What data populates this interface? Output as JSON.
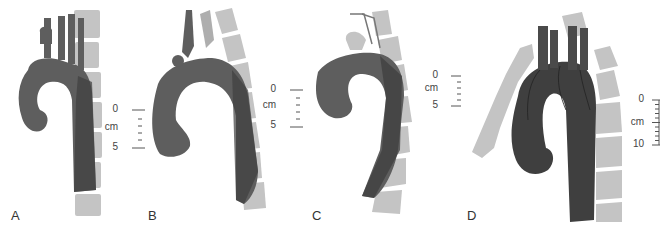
{
  "figure": {
    "panels": [
      {
        "id": "A",
        "label": "A",
        "scale": {
          "top": "0",
          "unit": "cm",
          "bottom": "5"
        }
      },
      {
        "id": "B",
        "label": "B",
        "scale": {
          "top": "0",
          "unit": "cm",
          "bottom": "5"
        }
      },
      {
        "id": "C",
        "label": "C",
        "scale": {
          "top": "0",
          "unit": "cm",
          "bottom": "5"
        }
      },
      {
        "id": "D",
        "label": "D",
        "scale": {
          "top": "0",
          "unit": "cm",
          "bottom": "10"
        }
      }
    ],
    "colors": {
      "aorta": "#5e5e5e",
      "aorta_dark": "#3f3f3f",
      "spine": "#c4c4c4",
      "spine_gap": "#ffffff",
      "text": "#333333"
    }
  }
}
